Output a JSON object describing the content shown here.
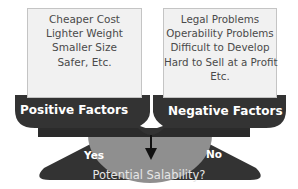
{
  "positive": {
    "items": [
      "Cheaper Cost",
      "Lighter Weight",
      "Smaller Size",
      "Safer, Etc."
    ],
    "label": "Positive Factors"
  },
  "negative": {
    "items": [
      "Legal Problems",
      "Operability Problems",
      "Difficult to Develop",
      "Hard to Sell at a Profit",
      "Etc."
    ],
    "label": "Negative Factors"
  },
  "base": {
    "yes_label": "Yes",
    "no_label": "No",
    "question": "Potential Salability?"
  },
  "colors": {
    "dark": "#333333",
    "box_fill": "#f1f1f1",
    "gauge": "#8f8f8f"
  }
}
